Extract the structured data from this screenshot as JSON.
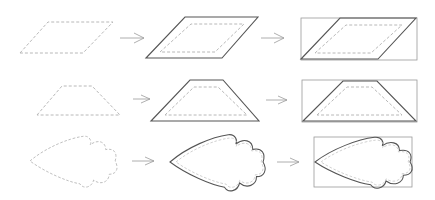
{
  "diagram": {
    "colors": {
      "dashed": "#b4b4b4",
      "solid": "#555555",
      "box": "#999999",
      "arrow": "#9a9a9a",
      "background": "#ffffff"
    },
    "rows": [
      {
        "shape": "parallelogram",
        "steps": [
          "dashed-outline",
          "offset-outline",
          "bounding-box"
        ]
      },
      {
        "shape": "trapezoid",
        "steps": [
          "dashed-outline",
          "offset-outline",
          "bounding-box"
        ]
      },
      {
        "shape": "leaf",
        "steps": [
          "dashed-outline",
          "offset-outline",
          "bounding-box"
        ]
      }
    ],
    "arrow_icon": "right-arrow"
  }
}
